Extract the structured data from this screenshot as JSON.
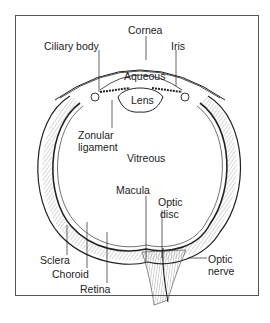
{
  "diagram": {
    "labels": {
      "cornea": "Cornea",
      "ciliary_body": "Ciliary body",
      "iris": "Iris",
      "aqueous": "Aqueous",
      "lens": "Lens",
      "zonular_ligament_line1": "Zonular",
      "zonular_ligament_line2": "ligament",
      "vitreous": "Vitreous",
      "macula": "Macula",
      "optic_disc_line1": "Optic",
      "optic_disc_line2": "disc",
      "sclera": "Sclera",
      "choroid": "Choroid",
      "retina": "Retina",
      "optic_nerve_line1": "Optic",
      "optic_nerve_line2": "nerve"
    },
    "colors": {
      "ink": "#222222",
      "frame": "#555555",
      "background": "#ffffff"
    }
  }
}
